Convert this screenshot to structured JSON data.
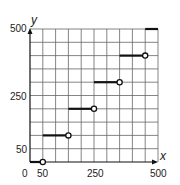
{
  "chart_data": {
    "type": "line",
    "subtype": "step-function",
    "title": "",
    "xlabel": "x",
    "ylabel": "y",
    "xlim": [
      0,
      500
    ],
    "ylim": [
      0,
      500
    ],
    "grid": true,
    "grid_step": 50,
    "x_tick_labels": [
      "0",
      "50",
      "250",
      "500"
    ],
    "y_tick_labels": [
      "50",
      "250",
      "500"
    ],
    "segments": [
      {
        "x_start": 0,
        "x_end": 50,
        "y": 0,
        "left": "closed",
        "right": "open"
      },
      {
        "x_start": 50,
        "x_end": 150,
        "y": 100,
        "left": "closed",
        "right": "open"
      },
      {
        "x_start": 150,
        "x_end": 250,
        "y": 200,
        "left": "closed",
        "right": "open"
      },
      {
        "x_start": 250,
        "x_end": 350,
        "y": 300,
        "left": "closed",
        "right": "open"
      },
      {
        "x_start": 350,
        "x_end": 450,
        "y": 400,
        "left": "closed",
        "right": "open"
      },
      {
        "x_start": 450,
        "x_end": 500,
        "y": 500,
        "left": "closed",
        "right": "continues"
      }
    ]
  },
  "labels": {
    "x_axis": "x",
    "y_axis": "y",
    "x_ticks": {
      "t0": "0",
      "t50": "50",
      "t250": "250",
      "t500": "500"
    },
    "y_ticks": {
      "t50": "50",
      "t250": "250",
      "t500": "500"
    }
  },
  "colors": {
    "line": "#111111",
    "grid": "#555555",
    "background": "#ffffff"
  }
}
